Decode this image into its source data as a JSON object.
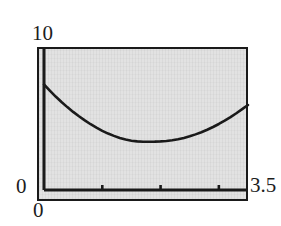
{
  "figure": {
    "background_color": "#ffffff",
    "panel_color": "#e2e2e2",
    "frame_color": "#1a1a1a",
    "curve_color": "#1a1a1a"
  },
  "labels": {
    "y_max": "10",
    "y_min": "0",
    "x_min": "0",
    "x_max": "3.5"
  },
  "chart_data": {
    "type": "line",
    "title": "",
    "subtitle": "",
    "xlabel": "",
    "ylabel": "",
    "xlim": [
      0,
      3.5
    ],
    "ylim": [
      0,
      10
    ],
    "grid": false,
    "legend": null,
    "x_tick_labels": [
      "0",
      "3.5"
    ],
    "y_tick_labels": [
      "0",
      "10"
    ],
    "x_minor_ticks": [
      1,
      2,
      3
    ],
    "y_minor_ticks": [],
    "annotations": [],
    "series": [
      {
        "name": "curve",
        "color": "#1a1a1a",
        "line_width": 2,
        "x": [
          0.0,
          0.1,
          0.2,
          0.3,
          0.4,
          0.5,
          0.6,
          0.7,
          0.8,
          0.9,
          1.0,
          1.1,
          1.2,
          1.3,
          1.4,
          1.5,
          1.6,
          1.7,
          1.8,
          1.9,
          2.0,
          2.1,
          2.2,
          2.3,
          2.4,
          2.5,
          2.6,
          2.7,
          2.8,
          2.9,
          3.0,
          3.1,
          3.2,
          3.3,
          3.4,
          3.5
        ],
        "y": [
          7.7,
          7.25,
          6.82,
          6.42,
          6.05,
          5.7,
          5.38,
          5.08,
          4.8,
          4.55,
          4.32,
          4.12,
          3.95,
          3.8,
          3.68,
          3.6,
          3.55,
          3.52,
          3.52,
          3.53,
          3.55,
          3.58,
          3.63,
          3.7,
          3.8,
          3.92,
          4.06,
          4.22,
          4.4,
          4.6,
          4.82,
          5.06,
          5.32,
          5.6,
          5.9,
          6.2
        ]
      },
      {
        "name": "x-axis-baseline",
        "color": "#1a1a1a",
        "line_width": 2,
        "x": [
          0,
          3.5
        ],
        "y": [
          0.1,
          0.1
        ]
      }
    ]
  }
}
